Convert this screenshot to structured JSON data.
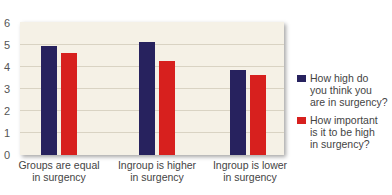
{
  "chart_data": {
    "type": "bar",
    "title": "",
    "xlabel": "",
    "ylabel": "",
    "ylim": [
      0,
      6
    ],
    "yticks": [
      0,
      1,
      2,
      3,
      4,
      5,
      6
    ],
    "grid": true,
    "legend_position": "right",
    "categories": [
      "Groups are equal in surgency",
      "Ingroup is higher in surgency",
      "Ingroup is lower in surgency"
    ],
    "series": [
      {
        "name": "How high do you think you are in surgency?",
        "color": "#27225e",
        "values": [
          4.9,
          5.1,
          3.85
        ]
      },
      {
        "name": "How important is it to be high in surgency?",
        "color": "#d7201e",
        "values": [
          4.6,
          4.25,
          3.6
        ]
      }
    ]
  },
  "axis": {
    "yticks": [
      "0",
      "1",
      "2",
      "3",
      "4",
      "5",
      "6"
    ]
  },
  "xlabels": [
    {
      "line1": "Groups are equal",
      "line2": "in surgency"
    },
    {
      "line1": "Ingroup is higher",
      "line2": "in surgency"
    },
    {
      "line1": "Ingroup is lower",
      "line2": "in surgency"
    }
  ],
  "legend": [
    {
      "line1": "How high do",
      "line2": "you think you",
      "line3": "are in surgency?"
    },
    {
      "line1": "How important",
      "line2": "is it to be high",
      "line3": "in surgency?"
    }
  ]
}
